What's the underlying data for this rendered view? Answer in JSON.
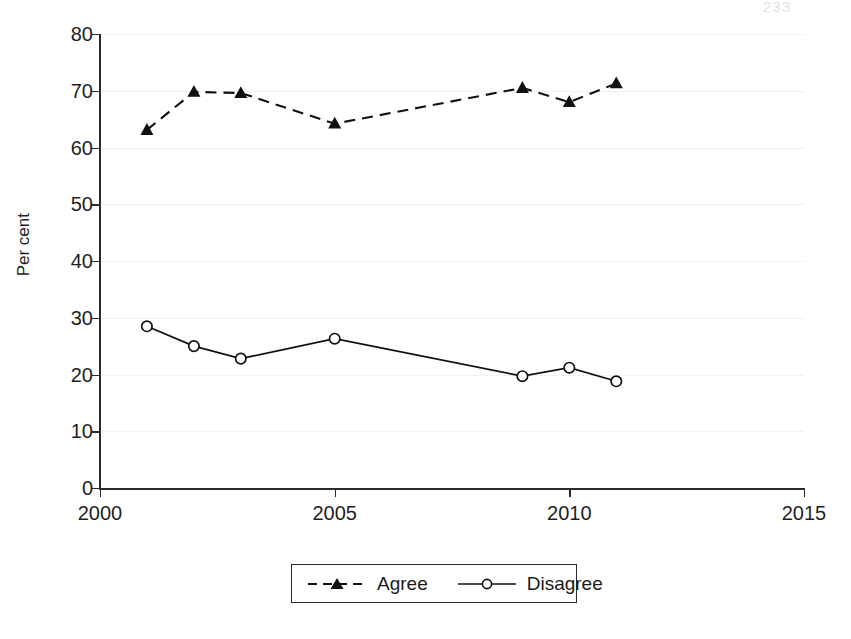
{
  "page": {
    "folio": "233"
  },
  "chart_data": {
    "type": "line",
    "title": "",
    "xlabel": "",
    "ylabel": "Per cent",
    "xlim": [
      2000,
      2015
    ],
    "ylim": [
      0,
      80
    ],
    "grid": true,
    "legend_position": "bottom-center",
    "x_ticks": [
      2000,
      2005,
      2010,
      2015
    ],
    "y_ticks": [
      0,
      10,
      20,
      30,
      40,
      50,
      60,
      70,
      80
    ],
    "x": [
      2001,
      2002,
      2003,
      2005,
      2009,
      2010,
      2011
    ],
    "series": [
      {
        "name": "Agree",
        "marker": "filled-triangle",
        "line_style": "dashed",
        "color": "#111111",
        "values": [
          63.1,
          69.8,
          69.6,
          64.2,
          70.5,
          68.0,
          71.3
        ]
      },
      {
        "name": "Disagree",
        "marker": "open-circle",
        "line_style": "solid",
        "color": "#111111",
        "values": [
          28.5,
          25.0,
          22.8,
          26.3,
          19.7,
          21.2,
          18.8
        ]
      }
    ]
  },
  "axis": {
    "y_tick_labels": [
      "80",
      "70",
      "60",
      "50",
      "40",
      "30",
      "20",
      "10",
      "0"
    ],
    "x_tick_labels": [
      "2000",
      "2005",
      "2010",
      "2015"
    ],
    "y_title": "Per cent"
  },
  "legend": {
    "entries": [
      {
        "label": "Agree"
      },
      {
        "label": "Disagree"
      }
    ]
  }
}
